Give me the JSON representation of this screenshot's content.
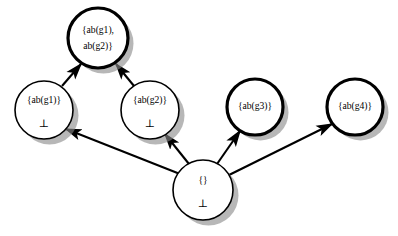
{
  "figure": {
    "name": "diagnosis-lattice",
    "background_color": "#ffffff",
    "node_fill_color": "#ffffff",
    "node_stroke_color": "#000000",
    "shadow_color": "#8a8a8a"
  },
  "nodes": [
    {
      "id": "top",
      "name": "node-ab-g1-ab-g2",
      "label_line1": "{ab(g1),",
      "label_line2": "ab(g2)}",
      "bottom_symbol": "",
      "cx": 98,
      "cy": 38,
      "r": 30,
      "stroke_width": 3.2,
      "emphasis": "thick"
    },
    {
      "id": "g1",
      "name": "node-ab-g1",
      "label_line1": "{ab(g1)}",
      "label_line2": "",
      "bottom_symbol": "⊥",
      "cx": 44,
      "cy": 110,
      "r": 29,
      "stroke_width": 1.6,
      "emphasis": "thin"
    },
    {
      "id": "g2",
      "name": "node-ab-g2",
      "label_line1": "{ab(g2)}",
      "label_line2": "",
      "bottom_symbol": "⊥",
      "cx": 150,
      "cy": 110,
      "r": 29,
      "stroke_width": 1.6,
      "emphasis": "thin"
    },
    {
      "id": "g3",
      "name": "node-ab-g3",
      "label_line1": "{ab(g3)}",
      "label_line2": "",
      "bottom_symbol": "",
      "cx": 255,
      "cy": 107,
      "r": 28,
      "stroke_width": 3.2,
      "emphasis": "thick"
    },
    {
      "id": "g4",
      "name": "node-ab-g4",
      "label_line1": "{ab(g4)}",
      "label_line2": "",
      "bottom_symbol": "",
      "cx": 355,
      "cy": 107,
      "r": 28,
      "stroke_width": 3.2,
      "emphasis": "thick"
    },
    {
      "id": "empty",
      "name": "node-empty-set",
      "label_line1": "{}",
      "label_line2": "",
      "bottom_symbol": "⊥",
      "cx": 203,
      "cy": 190,
      "r": 30,
      "stroke_width": 1.6,
      "emphasis": "thin"
    }
  ],
  "edges": [
    {
      "name": "edge-g1-to-top",
      "from": "g1",
      "to": "top",
      "x1": 62,
      "y1": 86,
      "x2": 81,
      "y2": 64
    },
    {
      "name": "edge-g2-to-top",
      "from": "g2",
      "to": "top",
      "x1": 134,
      "y1": 86,
      "x2": 116,
      "y2": 64
    },
    {
      "name": "edge-empty-to-g1",
      "from": "empty",
      "to": "g1",
      "x1": 180,
      "y1": 174,
      "x2": 66,
      "y2": 129
    },
    {
      "name": "edge-empty-to-g2",
      "from": "empty",
      "to": "g2",
      "x1": 189,
      "y1": 164,
      "x2": 165,
      "y2": 134
    },
    {
      "name": "edge-empty-to-g3",
      "from": "empty",
      "to": "g3",
      "x1": 217,
      "y1": 164,
      "x2": 240,
      "y2": 131
    },
    {
      "name": "edge-empty-to-g4",
      "from": "empty",
      "to": "g4",
      "x1": 227,
      "y1": 176,
      "x2": 332,
      "y2": 124
    }
  ]
}
